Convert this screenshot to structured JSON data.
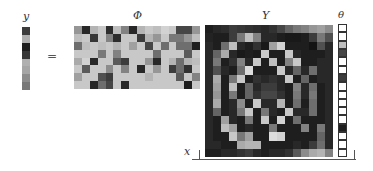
{
  "labels": {
    "y": "y",
    "phi": "Φ",
    "Y": "Y",
    "theta": "θ",
    "x": "x",
    "equals": "="
  },
  "vector_y": {
    "rows": 8,
    "values": [
      60,
      175,
      30,
      55,
      175,
      165,
      140,
      120
    ]
  },
  "matrix_phi": {
    "rows": 8,
    "cols": 16,
    "values": [
      [
        150,
        40,
        180,
        200,
        45,
        190,
        130,
        40,
        180,
        200,
        190,
        210,
        200,
        70,
        70,
        150
      ],
      [
        190,
        200,
        55,
        200,
        130,
        45,
        200,
        200,
        60,
        180,
        150,
        200,
        120,
        120,
        150,
        190
      ],
      [
        110,
        190,
        200,
        190,
        200,
        180,
        200,
        160,
        200,
        70,
        200,
        110,
        200,
        110,
        110,
        30
      ],
      [
        200,
        200,
        200,
        120,
        200,
        130,
        200,
        200,
        200,
        200,
        110,
        200,
        200,
        200,
        90,
        200
      ],
      [
        170,
        210,
        40,
        200,
        200,
        90,
        60,
        200,
        200,
        150,
        40,
        200,
        180,
        110,
        180,
        190
      ],
      [
        200,
        90,
        200,
        200,
        140,
        200,
        130,
        200,
        40,
        200,
        150,
        200,
        60,
        110,
        50,
        200
      ],
      [
        160,
        200,
        200,
        80,
        60,
        200,
        200,
        200,
        200,
        180,
        200,
        200,
        200,
        90,
        200,
        130
      ],
      [
        200,
        200,
        40,
        110,
        70,
        200,
        40,
        200,
        200,
        200,
        200,
        200,
        200,
        200,
        30,
        200
      ]
    ]
  },
  "matrix_Y": {
    "rows": 16,
    "cols": 16,
    "values": [
      [
        30,
        40,
        45,
        60,
        55,
        50,
        45,
        40,
        50,
        70,
        100,
        120,
        130,
        150,
        160,
        140
      ],
      [
        35,
        30,
        30,
        60,
        120,
        190,
        130,
        40,
        40,
        30,
        25,
        25,
        30,
        60,
        120,
        80
      ],
      [
        40,
        30,
        110,
        190,
        40,
        30,
        50,
        25,
        160,
        210,
        30,
        30,
        30,
        20,
        80,
        40
      ],
      [
        40,
        100,
        170,
        40,
        25,
        30,
        25,
        200,
        30,
        30,
        200,
        40,
        30,
        30,
        30,
        40
      ],
      [
        40,
        120,
        30,
        50,
        130,
        40,
        200,
        30,
        190,
        30,
        130,
        200,
        30,
        30,
        40,
        40
      ],
      [
        40,
        80,
        40,
        30,
        110,
        220,
        30,
        30,
        30,
        200,
        40,
        100,
        40,
        110,
        40,
        40
      ],
      [
        40,
        170,
        30,
        120,
        200,
        30,
        50,
        40,
        50,
        40,
        200,
        30,
        100,
        30,
        40,
        40
      ],
      [
        40,
        160,
        30,
        190,
        30,
        100,
        40,
        60,
        60,
        40,
        30,
        130,
        40,
        110,
        30,
        40
      ],
      [
        40,
        150,
        30,
        120,
        30,
        100,
        50,
        70,
        70,
        50,
        30,
        120,
        40,
        120,
        30,
        40
      ],
      [
        40,
        170,
        30,
        40,
        140,
        30,
        200,
        40,
        40,
        180,
        30,
        110,
        30,
        110,
        30,
        40
      ],
      [
        40,
        100,
        30,
        40,
        120,
        200,
        30,
        120,
        40,
        30,
        200,
        40,
        40,
        110,
        30,
        40
      ],
      [
        40,
        30,
        160,
        40,
        30,
        120,
        30,
        200,
        30,
        210,
        30,
        110,
        30,
        30,
        30,
        40
      ],
      [
        40,
        30,
        190,
        160,
        30,
        40,
        30,
        30,
        120,
        30,
        30,
        30,
        130,
        30,
        120,
        40
      ],
      [
        40,
        30,
        30,
        200,
        120,
        160,
        30,
        30,
        220,
        210,
        30,
        30,
        30,
        30,
        100,
        40
      ],
      [
        40,
        40,
        30,
        30,
        170,
        180,
        180,
        30,
        30,
        30,
        30,
        40,
        30,
        60,
        110,
        40
      ],
      [
        30,
        30,
        40,
        40,
        50,
        60,
        40,
        30,
        40,
        40,
        50,
        90,
        140,
        170,
        180,
        130
      ]
    ]
  },
  "vector_theta": {
    "rows": 16,
    "values": [
      255,
      255,
      190,
      70,
      255,
      255,
      60,
      255,
      255,
      255,
      255,
      255,
      30,
      255,
      255,
      255
    ]
  }
}
